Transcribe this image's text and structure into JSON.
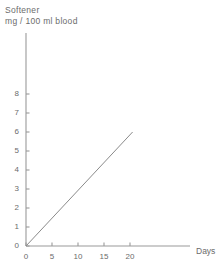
{
  "chart_data": {
    "type": "line",
    "title": "Softener mg / 100 ml blood",
    "title_lines": [
      "Softener",
      "mg / 100 ml blood"
    ],
    "ylabel": "Softener mg / 100 ml blood",
    "xlabel": "Days",
    "xlim": [
      0,
      25
    ],
    "ylim": [
      0,
      8.6
    ],
    "xticks": [
      0,
      5,
      10,
      15,
      20
    ],
    "yticks": [
      0,
      1,
      2,
      3,
      4,
      5,
      6,
      7,
      8
    ],
    "xtick_labels": [
      "0",
      "5",
      "10",
      "15",
      "20"
    ],
    "ytick_labels": [
      "0",
      "1",
      "2",
      "3",
      "4",
      "5",
      "6",
      "7",
      "8"
    ],
    "grid": false,
    "legend": false,
    "series": [
      {
        "name": "Softener in blood",
        "x": [
          0,
          20.5
        ],
        "values": [
          0,
          6.0
        ]
      }
    ],
    "line_color": "#8a8a8a",
    "axis_color": "#9a9a9a",
    "text_color": "#6b6b6b",
    "background": "#ffffff"
  }
}
